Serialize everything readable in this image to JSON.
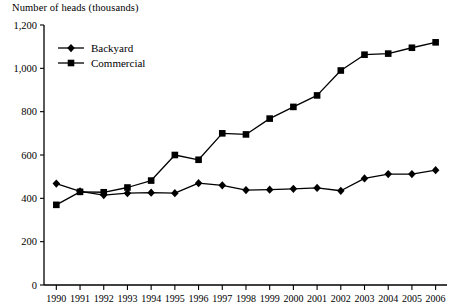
{
  "chart_data": {
    "type": "line",
    "title": "Number of heads (thousands)",
    "xlabel": "",
    "ylabel": "Number of heads (thousands)",
    "ylim": [
      0,
      1200
    ],
    "ytick_values": [
      0,
      200,
      400,
      600,
      800,
      1000,
      1200
    ],
    "ytick_labels": [
      "0",
      "200",
      "400",
      "600",
      "800",
      "1,000",
      "1,200"
    ],
    "grid": false,
    "legend_position": "top-left",
    "categories": [
      "1990",
      "1991",
      "1992",
      "1993",
      "1994",
      "1995",
      "1996",
      "1997",
      "1998",
      "1999",
      "2000",
      "2001",
      "2002",
      "2003",
      "2004",
      "2005",
      "2006"
    ],
    "series": [
      {
        "name": "Backyard",
        "marker": "diamond",
        "values": [
          468,
          432,
          415,
          424,
          426,
          424,
          470,
          460,
          438,
          440,
          444,
          448,
          435,
          492,
          512,
          512,
          530
        ]
      },
      {
        "name": "Commercial",
        "marker": "square",
        "values": [
          370,
          430,
          428,
          450,
          482,
          600,
          578,
          700,
          695,
          768,
          822,
          875,
          990,
          1063,
          1068,
          1095,
          1120
        ]
      }
    ],
    "colors": {
      "series_stroke": "#000000",
      "axis": "#000000",
      "background": "#ffffff"
    }
  },
  "legend": {
    "items": [
      {
        "label": "Backyard"
      },
      {
        "label": "Commercial"
      }
    ]
  }
}
